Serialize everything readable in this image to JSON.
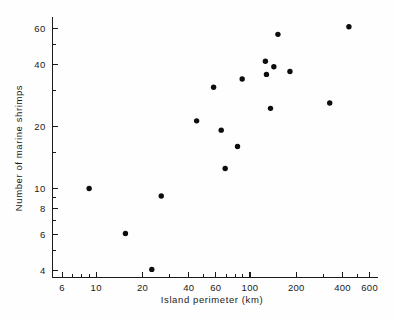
{
  "chart_data": {
    "type": "scatter",
    "title": "",
    "xlabel": "Island   perimeter   (km)",
    "ylabel": "Number  of  marine  shrimps",
    "xscale": "log",
    "yscale": "log",
    "xlim": [
      5.2,
      680
    ],
    "ylim": [
      3.7,
      68
    ],
    "grid": false,
    "legend": null,
    "x_ticks": [
      {
        "value": 6,
        "label": "6"
      },
      {
        "value": 10,
        "label": "10"
      },
      {
        "value": 20,
        "label": "20"
      },
      {
        "value": 40,
        "label": "40"
      },
      {
        "value": 60,
        "label": "60"
      },
      {
        "value": 100,
        "label": "100"
      },
      {
        "value": 200,
        "label": "200"
      },
      {
        "value": 400,
        "label": "400"
      },
      {
        "value": 600,
        "label": "600"
      }
    ],
    "x_minor_ticks": [
      7,
      8,
      9,
      30,
      50,
      70,
      80,
      90,
      300,
      500
    ],
    "y_ticks": [
      {
        "value": 4,
        "label": "4"
      },
      {
        "value": 6,
        "label": "6"
      },
      {
        "value": 8,
        "label": "8"
      },
      {
        "value": 10,
        "label": "10"
      },
      {
        "value": 20,
        "label": "20"
      },
      {
        "value": 40,
        "label": "40"
      },
      {
        "value": 60,
        "label": "60"
      }
    ],
    "y_minor_ticks": [
      5,
      7,
      9,
      15,
      30,
      50
    ],
    "series": [
      {
        "name": "islands",
        "marker": "filled-circle",
        "color": "#0d0d0d",
        "points": [
          {
            "x": 9.0,
            "y": 10.0
          },
          {
            "x": 15.5,
            "y": 6.05
          },
          {
            "x": 23.0,
            "y": 4.05
          },
          {
            "x": 26.5,
            "y": 9.2
          },
          {
            "x": 45.0,
            "y": 21.3
          },
          {
            "x": 58.0,
            "y": 31.0
          },
          {
            "x": 65.0,
            "y": 19.2
          },
          {
            "x": 69.0,
            "y": 12.5
          },
          {
            "x": 83.0,
            "y": 16.0
          },
          {
            "x": 89.0,
            "y": 34.0
          },
          {
            "x": 126.0,
            "y": 41.5
          },
          {
            "x": 128.0,
            "y": 35.8
          },
          {
            "x": 136.0,
            "y": 24.5
          },
          {
            "x": 143.0,
            "y": 39.0
          },
          {
            "x": 152.0,
            "y": 56.0
          },
          {
            "x": 182.0,
            "y": 37.0
          },
          {
            "x": 330.0,
            "y": 26.0
          },
          {
            "x": 440.0,
            "y": 61.0
          }
        ]
      }
    ]
  },
  "axes": {
    "x_axis_name": "island-perimeter-axis",
    "y_axis_name": "number-of-shrimps-axis"
  }
}
